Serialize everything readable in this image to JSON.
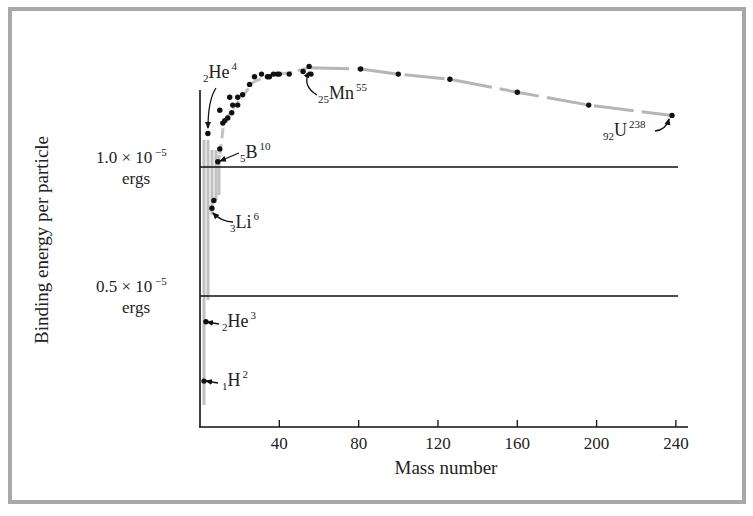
{
  "chart_data": {
    "type": "scatter",
    "title": "",
    "xlabel": "Mass number",
    "ylabel": "Binding energy per particle",
    "xlim": [
      0,
      245
    ],
    "ylim": [
      0,
      1.45
    ],
    "y_units_note": "×10^-5 ergs",
    "grid": false,
    "x_ticks": [
      40,
      80,
      120,
      160,
      200,
      240
    ],
    "x_tick_labels": [
      "40",
      "80",
      "120",
      "160",
      "200",
      "240"
    ],
    "reference_lines": [
      {
        "value": 1.0,
        "label_main": "1.0 × 10",
        "label_exp": "−5",
        "label_unit": "ergs"
      },
      {
        "value": 0.5,
        "label_main": "0.5 × 10",
        "label_exp": "−5",
        "label_unit": "ergs"
      }
    ],
    "series": [
      {
        "name": "Nuclides",
        "points": [
          [
            2,
            0.17
          ],
          [
            3,
            0.4
          ],
          [
            4,
            1.13
          ],
          [
            6,
            0.84
          ],
          [
            7,
            0.87
          ],
          [
            9,
            1.02
          ],
          [
            10,
            1.07
          ],
          [
            10,
            1.22
          ],
          [
            11.5,
            1.17
          ],
          [
            12.5,
            1.18
          ],
          [
            14,
            1.19
          ],
          [
            15,
            1.27
          ],
          [
            16,
            1.21
          ],
          [
            16.5,
            1.24
          ],
          [
            19,
            1.24
          ],
          [
            19,
            1.27
          ],
          [
            21.5,
            1.28
          ],
          [
            25,
            1.32
          ],
          [
            27.5,
            1.35
          ],
          [
            31,
            1.36
          ],
          [
            34,
            1.35
          ],
          [
            35,
            1.35
          ],
          [
            37,
            1.36
          ],
          [
            39,
            1.36
          ],
          [
            40,
            1.36
          ],
          [
            45,
            1.36
          ],
          [
            52,
            1.37
          ],
          [
            55,
            1.39
          ],
          [
            56,
            1.36
          ],
          [
            81,
            1.38
          ],
          [
            100,
            1.36
          ],
          [
            126,
            1.34
          ],
          [
            160,
            1.29
          ],
          [
            196,
            1.24
          ],
          [
            238,
            1.2
          ]
        ]
      }
    ],
    "trend_curve": [
      [
        55,
        1.385
      ],
      [
        81,
        1.38
      ],
      [
        100,
        1.36
      ],
      [
        126,
        1.34
      ],
      [
        160,
        1.29
      ],
      [
        196,
        1.24
      ],
      [
        238,
        1.2
      ]
    ],
    "rise_curve": [
      [
        10,
        1.05
      ],
      [
        12,
        1.17
      ],
      [
        16,
        1.22
      ],
      [
        21,
        1.27
      ],
      [
        27,
        1.33
      ],
      [
        35,
        1.355
      ],
      [
        45,
        1.365
      ],
      [
        55,
        1.385
      ]
    ],
    "annotations": [
      {
        "id": "h2",
        "pre": "1",
        "sym": "H",
        "sup": "2",
        "x": 2,
        "y": 0.17
      },
      {
        "id": "he3",
        "pre": "2",
        "sym": "He",
        "sup": "3",
        "x": 3,
        "y": 0.4
      },
      {
        "id": "he4",
        "pre": "2",
        "sym": "He",
        "sup": "4",
        "x": 4,
        "y": 1.13
      },
      {
        "id": "li6",
        "pre": "3",
        "sym": "Li",
        "sup": "6",
        "x": 6,
        "y": 0.84
      },
      {
        "id": "b10",
        "pre": "5",
        "sym": "B",
        "sup": "10",
        "x": 9,
        "y": 1.02
      },
      {
        "id": "mn55",
        "pre": "25",
        "sym": "Mn",
        "sup": "55",
        "x": 55,
        "y": 1.39
      },
      {
        "id": "u238",
        "pre": "92",
        "sym": "U",
        "sup": "238",
        "x": 238,
        "y": 1.2
      }
    ]
  }
}
